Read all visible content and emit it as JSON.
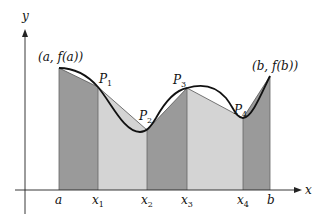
{
  "diagram": {
    "axes": {
      "x_label": "x",
      "y_label": "y"
    },
    "x_ticks": [
      {
        "main": "a",
        "sub": ""
      },
      {
        "main": "x",
        "sub": "1"
      },
      {
        "main": "x",
        "sub": "2"
      },
      {
        "main": "x",
        "sub": "3"
      },
      {
        "main": "x",
        "sub": "4"
      },
      {
        "main": "b",
        "sub": ""
      }
    ],
    "points": [
      {
        "main": "P",
        "sub": "1"
      },
      {
        "main": "P",
        "sub": "2"
      },
      {
        "main": "P",
        "sub": "3"
      },
      {
        "main": "P",
        "sub": "4"
      }
    ],
    "endpoint_left": "(a, f(a))",
    "endpoint_right": "(b, f(b))",
    "colors": {
      "dark_fill": "#9a9a9a",
      "light_fill": "#d4d4d4",
      "curve": "#111111"
    }
  }
}
